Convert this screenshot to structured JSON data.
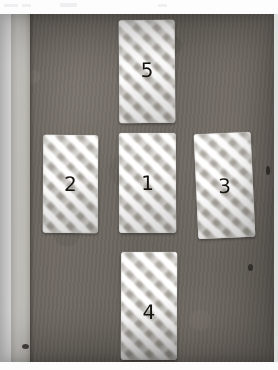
{
  "photo": {
    "subject": "five gingham-patterned rectangular fabric swatches arranged in a cross formation",
    "background_color": "#6f6962",
    "card_base_color": "#e6e3dd",
    "card_weave_color": "#96928b",
    "numeral_color": "#17150f",
    "left_strip_color": "#dedcd7",
    "margin_color": "#fcfcfc"
  },
  "cards": [
    {
      "id": "card-5",
      "label": "5",
      "position": "top"
    },
    {
      "id": "card-2",
      "label": "2",
      "position": "left"
    },
    {
      "id": "card-1",
      "label": "1",
      "position": "center"
    },
    {
      "id": "card-3",
      "label": "3",
      "position": "right"
    },
    {
      "id": "card-4",
      "label": "4",
      "position": "bottom"
    }
  ]
}
